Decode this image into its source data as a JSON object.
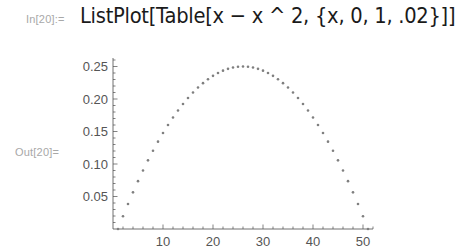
{
  "notebook": {
    "input_label": "In[20]:=",
    "input_code": "ListPlot[Table[x − x ^ 2, {x, 0, 1, .02}]]",
    "output_label": "Out[20]="
  },
  "colors": {
    "point": "#7f7f7f",
    "axis": "#4d4d4d",
    "label": "#a8a8a8",
    "code": "#1a1a1a"
  },
  "chart_data": {
    "type": "scatter",
    "title": "",
    "xlabel": "",
    "ylabel": "",
    "x": [
      1,
      2,
      3,
      4,
      5,
      6,
      7,
      8,
      9,
      10,
      11,
      12,
      13,
      14,
      15,
      16,
      17,
      18,
      19,
      20,
      21,
      22,
      23,
      24,
      25,
      26,
      27,
      28,
      29,
      30,
      31,
      32,
      33,
      34,
      35,
      36,
      37,
      38,
      39,
      40,
      41,
      42,
      43,
      44,
      45,
      46,
      47,
      48,
      49,
      50,
      51
    ],
    "values": [
      0,
      0.0196,
      0.0384,
      0.0564,
      0.0736,
      0.09,
      0.1056,
      0.1204,
      0.1344,
      0.1476,
      0.16,
      0.1716,
      0.1824,
      0.1924,
      0.2016,
      0.21,
      0.2176,
      0.2244,
      0.2304,
      0.2356,
      0.24,
      0.2436,
      0.2464,
      0.2484,
      0.2496,
      0.25,
      0.2496,
      0.2484,
      0.2464,
      0.2436,
      0.24,
      0.2356,
      0.2304,
      0.2244,
      0.2176,
      0.21,
      0.2016,
      0.1924,
      0.1824,
      0.1716,
      0.16,
      0.1476,
      0.1344,
      0.1204,
      0.1056,
      0.09,
      0.0736,
      0.0564,
      0.0384,
      0.0196,
      0
    ],
    "x_ticks": [
      10,
      20,
      30,
      40,
      50
    ],
    "x_tick_labels": [
      "10",
      "20",
      "30",
      "40",
      "50"
    ],
    "y_ticks": [
      0.05,
      0.1,
      0.15,
      0.2,
      0.25
    ],
    "y_tick_labels": [
      "0.05",
      "0.10",
      "0.15",
      "0.20",
      "0.25"
    ],
    "xlim": [
      0,
      52
    ],
    "ylim": [
      0,
      0.26
    ],
    "grid": false,
    "legend": null
  }
}
